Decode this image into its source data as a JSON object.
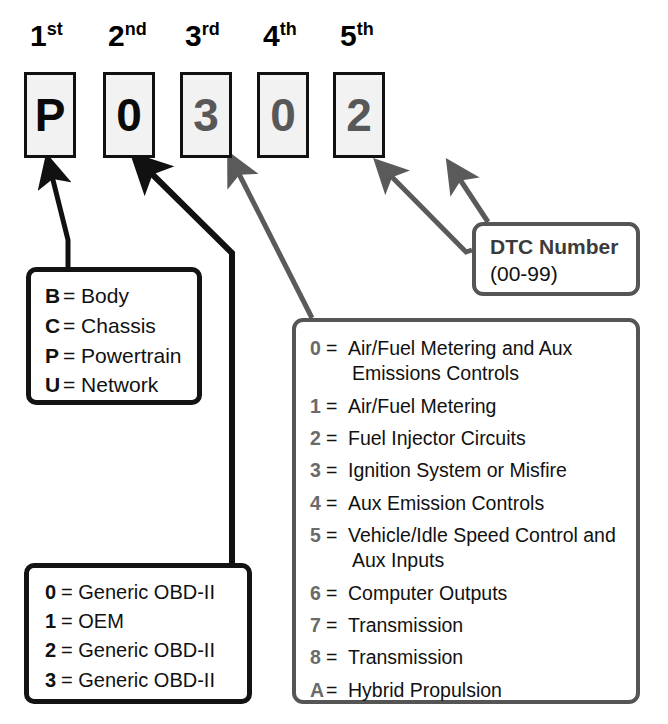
{
  "diagram": {
    "colors": {
      "dark": "#0a0a0a",
      "grey": "#585858",
      "grey_border": "#555555",
      "box_fill": "#f2f2f2",
      "key_grey": "#6a6a6a"
    }
  },
  "code_positions": [
    {
      "ordinal_num": "1",
      "ordinal_sup": "st",
      "char": "P",
      "tone": "dark"
    },
    {
      "ordinal_num": "2",
      "ordinal_sup": "nd",
      "char": "0",
      "tone": "dark"
    },
    {
      "ordinal_num": "3",
      "ordinal_sup": "rd",
      "char": "3",
      "tone": "grey"
    },
    {
      "ordinal_num": "4",
      "ordinal_sup": "th",
      "char": "0",
      "tone": "grey"
    },
    {
      "ordinal_num": "5",
      "ordinal_sup": "th",
      "char": "2",
      "tone": "grey"
    }
  ],
  "legend_first": {
    "items": [
      {
        "key": "B",
        "eq": "=",
        "desc": "Body"
      },
      {
        "key": "C",
        "eq": "=",
        "desc": "Chassis"
      },
      {
        "key": "P",
        "eq": "=",
        "desc": "Powertrain"
      },
      {
        "key": "U",
        "eq": "=",
        "desc": "Network"
      }
    ]
  },
  "legend_second": {
    "items": [
      {
        "key": "0",
        "eq": "=",
        "desc": "Generic OBD-II"
      },
      {
        "key": "1",
        "eq": "=",
        "desc": "OEM"
      },
      {
        "key": "2",
        "eq": "=",
        "desc": "Generic OBD-II"
      },
      {
        "key": "3",
        "eq": "=",
        "desc": "Generic OBD-II"
      }
    ]
  },
  "legend_third": {
    "items": [
      {
        "key": "0",
        "eq": "=",
        "desc": "Air/Fuel Metering and Aux Emissions Controls"
      },
      {
        "key": "1",
        "eq": "=",
        "desc": "Air/Fuel Metering"
      },
      {
        "key": "2",
        "eq": "=",
        "desc": "Fuel Injector Circuits"
      },
      {
        "key": "3",
        "eq": "=",
        "desc": "Ignition System or Misfire"
      },
      {
        "key": "4",
        "eq": "=",
        "desc": "Aux Emission Controls"
      },
      {
        "key": "5",
        "eq": "=",
        "desc": "Vehicle/Idle Speed Control and Aux Inputs"
      },
      {
        "key": "6",
        "eq": "=",
        "desc": "Computer Outputs"
      },
      {
        "key": "7",
        "eq": "=",
        "desc": "Transmission"
      },
      {
        "key": "8",
        "eq": "=",
        "desc": "Transmission"
      },
      {
        "key": "A",
        "eq": "=",
        "desc": "Hybrid Propulsion"
      }
    ]
  },
  "dtc_box": {
    "title": "DTC Number",
    "range": "(00-99)"
  }
}
